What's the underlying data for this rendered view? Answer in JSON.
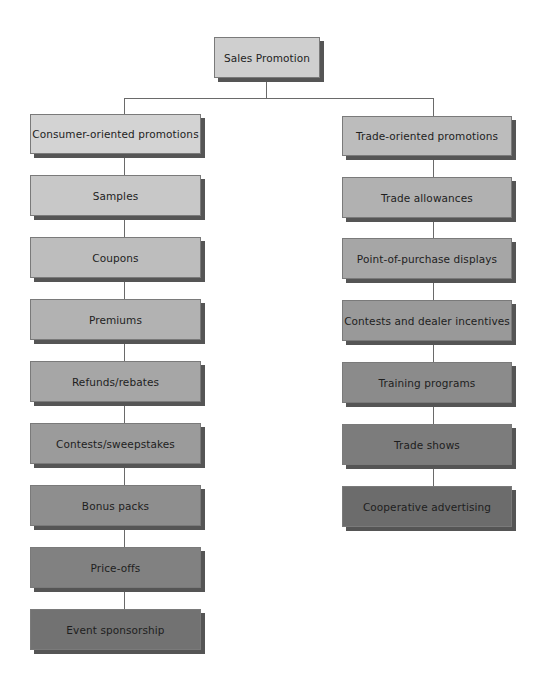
{
  "diagram": {
    "root": {
      "label": "Sales Promotion",
      "color": "#cfcfcf"
    },
    "branches": [
      {
        "header": {
          "label": "Consumer-oriented promotions",
          "color": "#d3d3d3"
        },
        "items": [
          {
            "label": "Samples",
            "color": "#c8c8c8"
          },
          {
            "label": "Coupons",
            "color": "#bdbdbd"
          },
          {
            "label": "Premiums",
            "color": "#b2b2b2"
          },
          {
            "label": "Refunds/rebates",
            "color": "#a6a6a6"
          },
          {
            "label": "Contests/sweepstakes",
            "color": "#9b9b9b"
          },
          {
            "label": "Bonus packs",
            "color": "#8e8e8e"
          },
          {
            "label": "Price-offs",
            "color": "#818181"
          },
          {
            "label": "Event sponsorship",
            "color": "#727272"
          }
        ]
      },
      {
        "header": {
          "label": "Trade-oriented promotions",
          "color": "#bcbcbc"
        },
        "items": [
          {
            "label": "Trade allowances",
            "color": "#b1b1b1"
          },
          {
            "label": "Point-of-purchase displays",
            "color": "#a6a6a6"
          },
          {
            "label": "Contests and dealer incentives",
            "color": "#999999"
          },
          {
            "label": "Training programs",
            "color": "#8b8b8b"
          },
          {
            "label": "Trade shows",
            "color": "#7c7c7c"
          },
          {
            "label": "Cooperative advertising",
            "color": "#6c6c6c"
          }
        ]
      }
    ]
  }
}
